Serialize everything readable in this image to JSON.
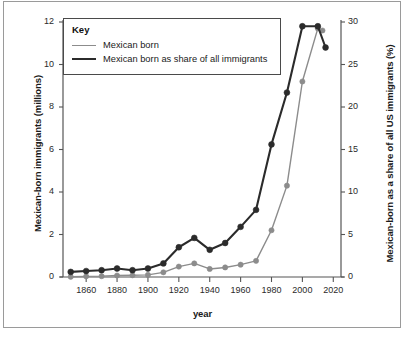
{
  "chart_data": {
    "type": "line",
    "title": "",
    "xlabel": "year",
    "ylabel": "Mexican-born immigrants (millions)",
    "ylabel_right": "Mexican-born as a share of all US immigrants (%)",
    "xlim": [
      1845,
      2025
    ],
    "ylim": [
      0,
      12
    ],
    "ylim_right": [
      0,
      30
    ],
    "xticks": [
      1860,
      1880,
      1900,
      1920,
      1940,
      1960,
      1980,
      2000,
      2020
    ],
    "xticklabels": [
      "1860",
      "1880",
      "1900",
      "1920",
      "1940",
      "1960",
      "1980",
      "2000",
      "2020"
    ],
    "yticks": [
      0,
      2,
      4,
      6,
      8,
      10,
      12
    ],
    "yticklabels": [
      "0",
      "2",
      "4",
      "6",
      "8",
      "10",
      "12"
    ],
    "yticks_right": [
      0,
      5,
      10,
      15,
      20,
      25,
      30
    ],
    "yticklabels_right": [
      "0",
      "5",
      "10",
      "15",
      "20",
      "25",
      "30"
    ],
    "grid": false,
    "legend_position": "top-left",
    "legend_title": "Key",
    "series": [
      {
        "name": "Mexican born",
        "axis": "left",
        "color": "#8c8c8c",
        "marker": "circle",
        "x": [
          1850,
          1860,
          1870,
          1880,
          1890,
          1900,
          1910,
          1920,
          1930,
          1940,
          1950,
          1960,
          1970,
          1980,
          1990,
          2000,
          2010,
          2013
        ],
        "values": [
          0.01,
          0.03,
          0.04,
          0.07,
          0.08,
          0.1,
          0.22,
          0.49,
          0.64,
          0.38,
          0.45,
          0.58,
          0.76,
          2.2,
          4.3,
          9.2,
          11.7,
          11.6
        ]
      },
      {
        "name": "Mexican born as share of all immigrants",
        "axis": "right",
        "color": "#2b2b2b",
        "marker": "circle",
        "x": [
          1850,
          1860,
          1870,
          1880,
          1890,
          1900,
          1910,
          1920,
          1930,
          1940,
          1950,
          1960,
          1970,
          1980,
          1990,
          2000,
          2010,
          2015
        ],
        "values": [
          0.6,
          0.7,
          0.8,
          1.0,
          0.8,
          1.0,
          1.6,
          3.5,
          4.6,
          3.2,
          4.0,
          5.9,
          7.9,
          15.6,
          21.7,
          29.5,
          29.5,
          27.0
        ]
      }
    ]
  },
  "legend": {
    "title": "Key",
    "items": [
      {
        "label": "Mexican born",
        "color": "#8c8c8c",
        "width": 1.4
      },
      {
        "label": "Mexican born as share of all immigrants",
        "color": "#2b2b2b",
        "width": 2.2
      }
    ]
  },
  "axes": {
    "x_title": "year",
    "y_left_title": "Mexican-born immigrants (millions)",
    "y_right_title": "Mexican-born as a share of all US immigrants (%)"
  }
}
